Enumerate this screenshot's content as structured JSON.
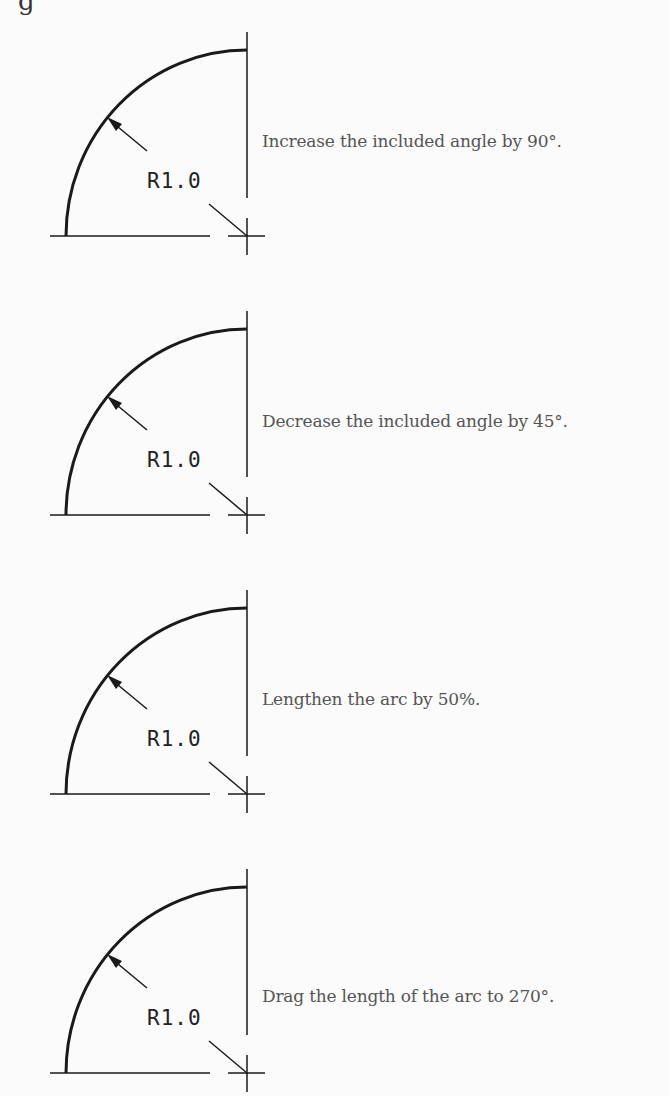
{
  "page": {
    "top_fragment": "g",
    "background": "#fbfbfb",
    "line_color": "#1a1a1a",
    "text_color": "#555555"
  },
  "panels": [
    {
      "dimension_label": "R1.0",
      "instruction": "Increase the included angle by 90°.",
      "center_y": 236
    },
    {
      "dimension_label": "R1.0",
      "instruction": "Decrease the included angle by 45°.",
      "center_y": 515
    },
    {
      "dimension_label": "R1.0",
      "instruction": "Lengthen the arc by 50%.",
      "center_y": 794
    },
    {
      "dimension_label": "R1.0",
      "instruction": "Drag the length of the arc to 270°.",
      "center_y": 1073
    }
  ]
}
